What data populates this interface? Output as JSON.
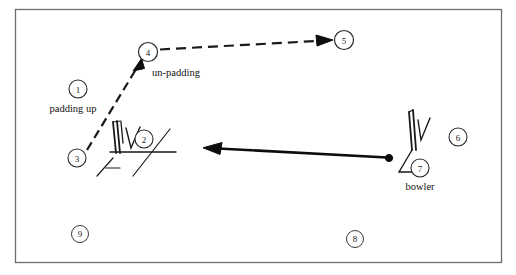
{
  "figure": {
    "type": "cricket-field-sequence-diagram",
    "frame": {
      "stroke_color": "#6d6d6d",
      "fill_color": "#ffffff",
      "x": 15,
      "y": 9,
      "width": 487,
      "height": 254
    },
    "stroke_color": "#1a1a1a",
    "markers": [
      {
        "id": "marker-1",
        "label": "1",
        "cx": 78,
        "cy": 89,
        "r": 9
      },
      {
        "id": "marker-2",
        "label": "2",
        "cx": 144,
        "cy": 139,
        "r": 9
      },
      {
        "id": "marker-3",
        "label": "3",
        "cx": 77,
        "cy": 158,
        "r": 9
      },
      {
        "id": "marker-4",
        "label": "4",
        "cx": 148,
        "cy": 52,
        "r": 9.5
      },
      {
        "id": "marker-5",
        "label": "5",
        "cx": 344,
        "cy": 40,
        "r": 9.5
      },
      {
        "id": "marker-6",
        "label": "6",
        "cx": 458,
        "cy": 137,
        "r": 9
      },
      {
        "id": "marker-7",
        "label": "7",
        "cx": 420,
        "cy": 168,
        "r": 9
      },
      {
        "id": "marker-8",
        "label": "8",
        "cx": 355,
        "cy": 239,
        "r": 8.5
      },
      {
        "id": "marker-9",
        "label": "9",
        "cx": 80,
        "cy": 234,
        "r": 8.5
      }
    ],
    "captions": [
      {
        "id": "caption-padding-up",
        "text": "padding up",
        "x": 73,
        "y": 112,
        "anchor": "middle"
      },
      {
        "id": "caption-un-padding",
        "text": "un-padding",
        "x": 176,
        "y": 76,
        "anchor": "middle"
      },
      {
        "id": "caption-bowler",
        "text": "bowler",
        "x": 420,
        "y": 190,
        "anchor": "middle"
      }
    ],
    "arrows": [
      {
        "id": "arrow-padding-path",
        "style": "dashed",
        "from": {
          "x": 88,
          "y": 150
        },
        "to": {
          "x": 141,
          "y": 62
        },
        "description": "dashed arrow from marker 3 up to marker 4"
      },
      {
        "id": "arrow-exit-path",
        "style": "dashed",
        "from": {
          "x": 160,
          "y": 49
        },
        "to": {
          "x": 332,
          "y": 40
        },
        "description": "dashed arrow from marker 4 right to marker 5"
      },
      {
        "id": "arrow-ball-delivery",
        "style": "solid-thick",
        "from": {
          "x": 388,
          "y": 158
        },
        "to": {
          "x": 204,
          "y": 148
        },
        "description": "solid thick arrow from bowler ball leftwards toward batsman wicket"
      }
    ],
    "wickets": [
      {
        "id": "wicket-batsman",
        "x": 112,
        "y": 120
      },
      {
        "id": "wicket-bowler",
        "x": 408,
        "y": 108
      }
    ],
    "ball": {
      "id": "ball-marker",
      "cx": 389,
      "cy": 158,
      "r": 3.6
    }
  }
}
